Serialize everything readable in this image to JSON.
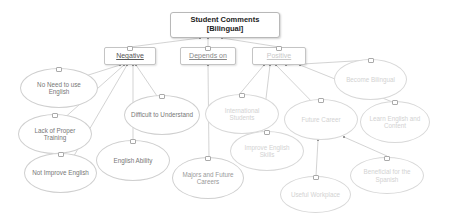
{
  "root": {
    "line1": "Student Comments",
    "line2": "[Bilingual]"
  },
  "categories": {
    "negative": "Negative",
    "depends_on": "Depends on",
    "positive": "Positive"
  },
  "negative_items": [
    "No Need to use English",
    "Lack of Proper Training",
    "Not Improve English",
    "Difficult to Understand",
    "English Ability"
  ],
  "depends_on_items": [
    "Majors and Future Careers"
  ],
  "positive_items": [
    "International Students",
    "Improve English Skills",
    "Future Career",
    "Become Bilingual",
    "Learn English and Content",
    "Useful Workplace",
    "Beneficial for the Spanish"
  ],
  "colors": {
    "edge": "#c8c8c8",
    "negative_text": "#555555",
    "depends_text": "#888888",
    "positive_text": "#c8c8c8"
  }
}
